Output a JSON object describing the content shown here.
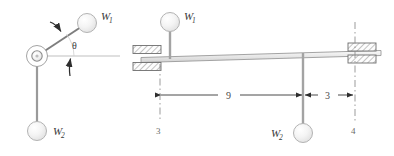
{
  "figure": {
    "background_color": "#ffffff",
    "line_color": "#6e6e6e",
    "label_color": "#3a3a3a",
    "sphere_fill": "#f2f2f2",
    "sphere_stroke": "#b0b0b0",
    "hatch_color": "#808080"
  },
  "left_panel": {
    "name": "pivoted-arm-diagram",
    "pivot": {
      "label": "pivot",
      "cx": 37,
      "cy": 56
    },
    "upper_arm": {
      "from_x": 37,
      "from_y": 56,
      "to_x": 79,
      "to_y": 27
    },
    "lower_arm": {
      "from_x": 37,
      "from_y": 56,
      "to_x": 37,
      "to_y": 122
    },
    "horizontal_reference": {
      "from_x": 37,
      "from_y": 56,
      "to_x": 120,
      "to_y": 56
    },
    "angle": {
      "symbol": "θ",
      "label_x": 76,
      "label_y": 48
    },
    "weights": [
      {
        "name": "weight-w1",
        "label": "W",
        "subscript": "1",
        "cx": 87,
        "cy": 23,
        "r": 9.5,
        "label_x": 102,
        "label_y": 19
      },
      {
        "name": "weight-w2",
        "label": "W",
        "subscript": "2",
        "cx": 37,
        "cy": 130,
        "r": 9.5,
        "label_x": 54,
        "label_y": 134
      }
    ],
    "arrows": [
      {
        "name": "arm-force-arrow",
        "desc": "curved arrow onto upper arm"
      },
      {
        "name": "angle-indicator-arrow",
        "desc": "curved arrow pointing to theta"
      }
    ]
  },
  "right_panel": {
    "name": "supported-beam-diagram",
    "beam": {
      "left_x": 141,
      "right_x": 381,
      "left_y": 55,
      "right_y": 50,
      "thickness": 5
    },
    "supports": [
      {
        "name": "support-left",
        "x": 143,
        "y": 55
      },
      {
        "name": "support-right",
        "x": 362,
        "y": 50
      }
    ],
    "weights": [
      {
        "name": "weight-w1",
        "label": "W",
        "subscript": "1",
        "cx": 170,
        "cy": 22,
        "r": 9.5,
        "label_x": 185,
        "label_y": 19,
        "hanger_from_y": 31,
        "hanger_to_y": 53
      },
      {
        "name": "weight-w2",
        "label": "W",
        "subscript": "2",
        "cx": 303,
        "cy": 133,
        "r": 9.5,
        "label_x": 272,
        "label_y": 137,
        "hanger_from_y": 52,
        "hanger_to_y": 124
      }
    ],
    "dimensions": [
      {
        "name": "dimension-9",
        "value": "9",
        "from_x": 160,
        "to_x": 303,
        "y": 95,
        "label_x": 229,
        "label_y": 92
      },
      {
        "name": "dimension-3",
        "value": "3",
        "from_x": 303,
        "to_x": 355,
        "y": 95,
        "label_x": 328,
        "label_y": 92
      }
    ],
    "reference_marks": [
      {
        "name": "ref-mark-3",
        "value": "3",
        "x": 158,
        "y": 131
      },
      {
        "name": "ref-mark-4",
        "value": "4",
        "x": 353,
        "y": 131
      }
    ]
  }
}
